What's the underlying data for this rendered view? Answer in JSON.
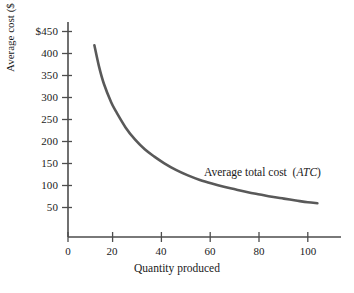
{
  "chart_data": {
    "type": "line",
    "title": "",
    "subtitle": "",
    "xlabel": "Quantity produced",
    "ylabel": "Average cost ($ million)",
    "xlim": [
      0,
      110
    ],
    "ylim": [
      0,
      450
    ],
    "grid": false,
    "legend_position": "inline-annotation",
    "x_ticks": [
      0,
      20,
      40,
      60,
      80,
      100
    ],
    "x_tick_labels": [
      "0",
      "20",
      "40",
      "60",
      "80",
      "100"
    ],
    "y_ticks": [
      50,
      100,
      150,
      200,
      250,
      300,
      350,
      400,
      450
    ],
    "y_tick_labels": [
      "50",
      "100",
      "150",
      "200",
      "250",
      "300",
      "350",
      "400",
      "$450"
    ],
    "series": [
      {
        "name": "Average total cost (ATC)",
        "annotation": "Average total cost (ATC)",
        "annotation_plain": "Average total cost",
        "annotation_italic": "ATC",
        "color": "#595959",
        "line_width": 2.6,
        "x": [
          11,
          13,
          15,
          18,
          20,
          24,
          28,
          32,
          36,
          40,
          45,
          50,
          55,
          60,
          65,
          70,
          75,
          80,
          85,
          90,
          95,
          100,
          104
        ],
        "y": [
          420,
          372,
          335,
          295,
          275,
          240,
          213,
          192,
          176,
          162,
          147,
          135,
          125,
          117,
          110,
          104,
          98,
          93,
          88,
          84,
          80,
          76,
          74
        ]
      }
    ]
  },
  "axis": {
    "y_title": "Average cost ($ million)",
    "x_title": "Quantity produced"
  },
  "colors": {
    "curve": "#595959",
    "axis": "#4d4d4d",
    "text": "#1a1a1a",
    "background": "#ffffff"
  }
}
